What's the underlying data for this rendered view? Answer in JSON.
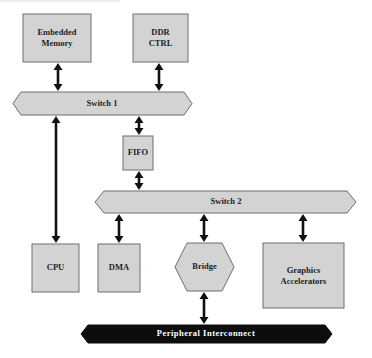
{
  "diagram": {
    "title": "",
    "colors": {
      "block_fill": "#d3d3d3",
      "block_stroke": "#6e6e6e",
      "arrow": "#111111",
      "peripheral_bus_fill": "#0d0d0d",
      "peripheral_bus_text": "#ffffff",
      "text": "#1e1e1e"
    },
    "blocks": {
      "embedded_memory": {
        "line1": "Embedded",
        "line2": "Memory"
      },
      "ddr_ctrl": {
        "line1": "DDR",
        "line2": "CTRL"
      },
      "fifo": {
        "label": "FIFO"
      },
      "cpu": {
        "label": "CPU"
      },
      "dma": {
        "label": "DMA"
      },
      "bridge": {
        "label": "Bridge",
        "shape": "hexagon"
      },
      "graphics_accelerators": {
        "line1": "Graphics",
        "line2": "Accelerators"
      }
    },
    "buses": {
      "switch1": {
        "label": "Switch 1"
      },
      "switch2": {
        "label": "Switch 2"
      },
      "peripheral": {
        "label": "Peripheral  Interconnect"
      }
    },
    "connections": [
      {
        "from": "Embedded Memory",
        "to": "Switch 1",
        "type": "bidirectional"
      },
      {
        "from": "DDR CTRL",
        "to": "Switch 1",
        "type": "bidirectional"
      },
      {
        "from": "Switch 1",
        "to": "CPU",
        "type": "bidirectional"
      },
      {
        "from": "Switch 1",
        "to": "FIFO",
        "type": "bidirectional"
      },
      {
        "from": "FIFO",
        "to": "Switch 2",
        "type": "bidirectional"
      },
      {
        "from": "Switch 2",
        "to": "DMA",
        "type": "bidirectional"
      },
      {
        "from": "Switch 2",
        "to": "Bridge",
        "type": "bidirectional"
      },
      {
        "from": "Switch 2",
        "to": "Graphics Accelerators",
        "type": "bidirectional"
      },
      {
        "from": "Bridge",
        "to": "Peripheral Interconnect",
        "type": "bidirectional"
      }
    ]
  }
}
